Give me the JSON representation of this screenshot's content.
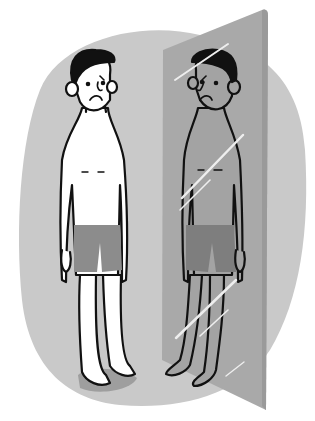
{
  "illustration": {
    "subject": "sad man looking at reflection in mirror",
    "colors": {
      "background": "#ffffff",
      "blob": "#c9c9c9",
      "mirror": "#a9a9a9",
      "mirror_edge": "#9a9a9a",
      "skin": "#ffffff",
      "reflection_skin": "#a3a3a3",
      "outline": "#111111",
      "shorts": "#8c8c8c",
      "reflection_shorts": "#7e7e7e",
      "floor_shadow": "#9e9e9e",
      "glint": "#eeeeee"
    }
  }
}
